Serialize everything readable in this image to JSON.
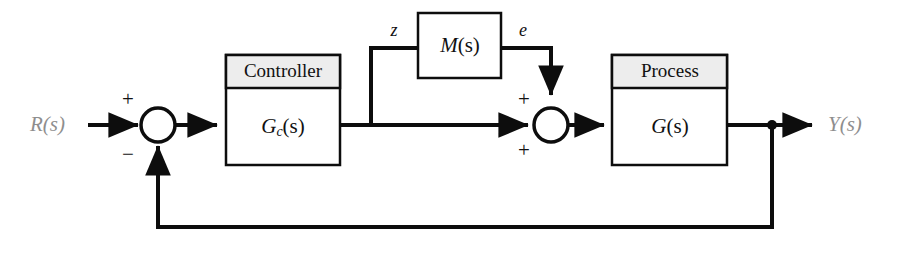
{
  "diagram": {
    "type": "control-block-diagram",
    "background_color": "#ffffff",
    "line_color": "#0d0d0d",
    "header_fill_color": "#ededed",
    "io_label_color": "#8e8e8e",
    "input": {
      "label": "R(s)",
      "name": "reference-input"
    },
    "output": {
      "label": "Y(s)",
      "name": "system-output"
    },
    "blocks": [
      {
        "id": "controller",
        "header": "Controller",
        "body_main": "G",
        "body_sub": "c",
        "body_tail": "(s)",
        "has_header": true
      },
      {
        "id": "measurement",
        "header": "",
        "body_main": "M",
        "body_sub": "",
        "body_tail": "(s)",
        "has_header": false
      },
      {
        "id": "process",
        "header": "Process",
        "body_main": "G",
        "body_sub": "",
        "body_tail": "(s)",
        "has_header": true
      }
    ],
    "summing_junctions": [
      {
        "id": "error-junction",
        "signs": {
          "top": "+",
          "bottom": "−"
        }
      },
      {
        "id": "disturbance-junction",
        "signs": {
          "top": "+",
          "bottom": "+"
        }
      }
    ],
    "signals": [
      {
        "id": "z-signal",
        "label": "z"
      },
      {
        "id": "e-signal",
        "label": "e"
      }
    ]
  }
}
